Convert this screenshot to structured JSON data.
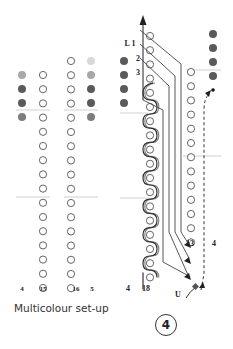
{
  "caption": "Multicolour set-up",
  "figure_number": "4",
  "colors": {
    "hole_stroke": "#555555",
    "yarn_dark": "#5a5a5a",
    "yarn_mid": "#7d7d7d",
    "yarn_light": "#a8a8a8",
    "yarn_pale": "#d9d9d9",
    "line": "#444444",
    "guide": "#bbbbbb"
  },
  "left_panel": {
    "labels": [
      {
        "text": "4",
        "x": 22,
        "y": 291
      },
      {
        "text": "15",
        "x": 43,
        "y": 291
      },
      {
        "text": "16",
        "x": 76,
        "y": 291
      },
      {
        "text": "5",
        "x": 92,
        "y": 291
      }
    ],
    "hole_columns": [
      {
        "x": 43,
        "start_y": 75,
        "count": 16
      },
      {
        "x": 71,
        "start_y": 61,
        "count": 17
      }
    ],
    "color_dots": [
      {
        "x": 22,
        "y": 75,
        "shade": "yarn_light"
      },
      {
        "x": 22,
        "y": 89,
        "shade": "yarn_dark"
      },
      {
        "x": 22,
        "y": 103,
        "shade": "yarn_dark"
      },
      {
        "x": 22,
        "y": 117,
        "shade": "yarn_mid"
      },
      {
        "x": 91,
        "y": 61,
        "shade": "yarn_pale"
      },
      {
        "x": 91,
        "y": 75,
        "shade": "yarn_light"
      },
      {
        "x": 91,
        "y": 89,
        "shade": "yarn_dark"
      },
      {
        "x": 91,
        "y": 103,
        "shade": "yarn_dark"
      },
      {
        "x": 91,
        "y": 117,
        "shade": "yarn_mid"
      }
    ],
    "guides": [
      {
        "x1": 16,
        "x2": 50,
        "y": 110
      },
      {
        "x1": 64,
        "x2": 98,
        "y": 110
      },
      {
        "x1": 16,
        "x2": 50,
        "y": 197
      },
      {
        "x1": 64,
        "x2": 98,
        "y": 197
      }
    ]
  },
  "right_panel": {
    "labels": [
      {
        "text": "L 1",
        "x": 130,
        "y": 46
      },
      {
        "text": "2",
        "x": 138,
        "y": 61
      },
      {
        "text": "3",
        "x": 138,
        "y": 75
      },
      {
        "text": "13",
        "x": 190,
        "y": 246
      },
      {
        "text": "4",
        "x": 214,
        "y": 246
      },
      {
        "text": "4",
        "x": 128,
        "y": 291
      },
      {
        "text": "18",
        "x": 146,
        "y": 291
      },
      {
        "text": "U",
        "x": 178,
        "y": 297
      }
    ],
    "threaded_column": {
      "x": 150,
      "start_y": 36,
      "count": 18
    },
    "plain_column": {
      "x": 191,
      "start_y": 72,
      "count": 13
    },
    "color_dots": [
      {
        "x": 124,
        "y": 61,
        "shade": "yarn_dark"
      },
      {
        "x": 124,
        "y": 75,
        "shade": "yarn_dark"
      },
      {
        "x": 124,
        "y": 89,
        "shade": "yarn_dark"
      },
      {
        "x": 124,
        "y": 103,
        "shade": "yarn_dark"
      },
      {
        "x": 213,
        "y": 34,
        "shade": "yarn_dark"
      },
      {
        "x": 213,
        "y": 48,
        "shade": "yarn_dark"
      },
      {
        "x": 213,
        "y": 62,
        "shade": "yarn_dark"
      },
      {
        "x": 213,
        "y": 76,
        "shade": "yarn_dark"
      }
    ],
    "guides": [
      {
        "x1": 186,
        "x2": 221,
        "y": 70
      },
      {
        "x1": 120,
        "x2": 148,
        "y": 113
      },
      {
        "x1": 183,
        "x2": 221,
        "y": 156
      },
      {
        "x1": 120,
        "x2": 148,
        "y": 198
      }
    ]
  }
}
